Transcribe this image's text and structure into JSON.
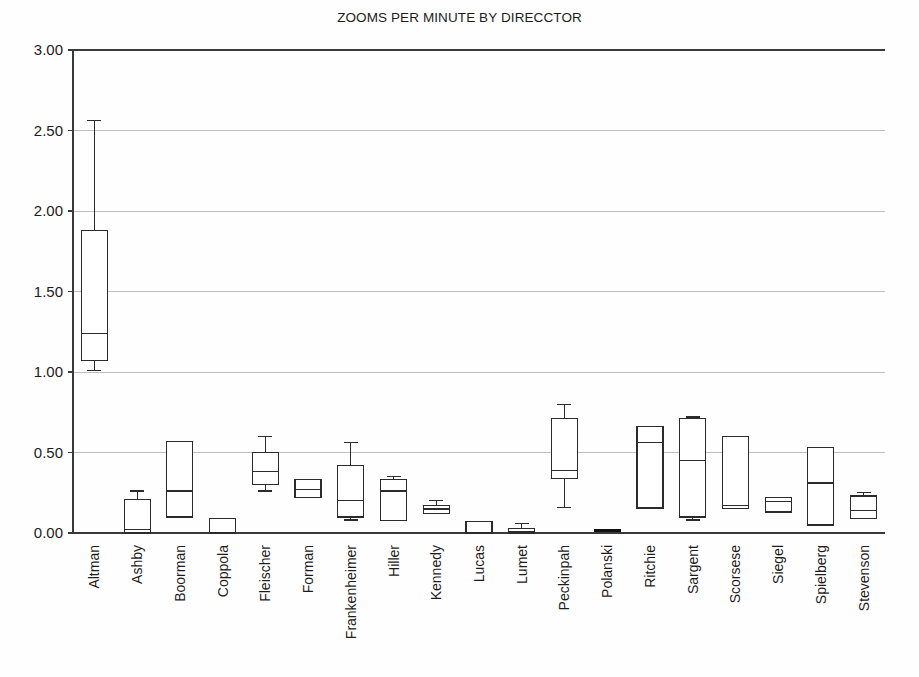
{
  "chart_data": {
    "type": "box",
    "title": "ZOOMS PER MINUTE BY DIRECCTOR",
    "xlabel": "",
    "ylabel": "",
    "ylim": [
      0.0,
      3.0
    ],
    "ytick_values": [
      0.0,
      0.5,
      1.0,
      1.5,
      2.0,
      2.5,
      3.0
    ],
    "ytick_labels": [
      "0.00",
      "0.50",
      "1.00",
      "1.50",
      "2.00",
      "2.50",
      "3.00"
    ],
    "grid": true,
    "legend": "none",
    "categories": [
      "Altman",
      "Ashby",
      "Boorman",
      "Coppola",
      "Fleischer",
      "Forman",
      "Frankenheimer",
      "Hiller",
      "Kennedy",
      "Lucas",
      "Lumet",
      "Peckinpah",
      "Polanski",
      "Ritchie",
      "Sargent",
      "Scorsese",
      "Siegel",
      "Spielberg",
      "Stevenson"
    ],
    "boxes": [
      {
        "name": "Altman",
        "whisker_low": 1.01,
        "q1": 1.07,
        "median": 1.24,
        "q3": 1.88,
        "whisker_high": 2.56
      },
      {
        "name": "Ashby",
        "whisker_low": 0.0,
        "q1": 0.0,
        "median": 0.02,
        "q3": 0.21,
        "whisker_high": 0.26
      },
      {
        "name": "Boorman",
        "whisker_low": 0.1,
        "q1": 0.1,
        "median": 0.26,
        "q3": 0.57,
        "whisker_high": 0.57
      },
      {
        "name": "Coppola",
        "whisker_low": 0.0,
        "q1": 0.0,
        "median": 0.0,
        "q3": 0.09,
        "whisker_high": 0.09
      },
      {
        "name": "Fleischer",
        "whisker_low": 0.26,
        "q1": 0.3,
        "median": 0.38,
        "q3": 0.5,
        "whisker_high": 0.6
      },
      {
        "name": "Forman",
        "whisker_low": 0.22,
        "q1": 0.22,
        "median": 0.27,
        "q3": 0.33,
        "whisker_high": 0.33
      },
      {
        "name": "Frankenheimer",
        "whisker_low": 0.08,
        "q1": 0.1,
        "median": 0.2,
        "q3": 0.42,
        "whisker_high": 0.56
      },
      {
        "name": "Hiller",
        "whisker_low": 0.08,
        "q1": 0.08,
        "median": 0.26,
        "q3": 0.33,
        "whisker_high": 0.35
      },
      {
        "name": "Kennedy",
        "whisker_low": 0.12,
        "q1": 0.12,
        "median": 0.15,
        "q3": 0.17,
        "whisker_high": 0.2
      },
      {
        "name": "Lucas",
        "whisker_low": 0.0,
        "q1": 0.0,
        "median": 0.0,
        "q3": 0.07,
        "whisker_high": 0.07
      },
      {
        "name": "Lumet",
        "whisker_low": 0.0,
        "q1": 0.0,
        "median": 0.01,
        "q3": 0.03,
        "whisker_high": 0.06
      },
      {
        "name": "Peckinpah",
        "whisker_low": 0.16,
        "q1": 0.34,
        "median": 0.39,
        "q3": 0.71,
        "whisker_high": 0.8
      },
      {
        "name": "Polanski",
        "whisker_low": 0.01,
        "q1": 0.01,
        "median": 0.015,
        "q3": 0.02,
        "whisker_high": 0.02,
        "filled": true
      },
      {
        "name": "Ritchie",
        "whisker_low": 0.155,
        "q1": 0.155,
        "median": 0.56,
        "q3": 0.66,
        "whisker_high": 0.66
      },
      {
        "name": "Sargent",
        "whisker_low": 0.08,
        "q1": 0.1,
        "median": 0.45,
        "q3": 0.71,
        "whisker_high": 0.72
      },
      {
        "name": "Scorsese",
        "whisker_low": 0.15,
        "q1": 0.15,
        "median": 0.17,
        "q3": 0.6,
        "whisker_high": 0.6
      },
      {
        "name": "Siegel",
        "whisker_low": 0.13,
        "q1": 0.13,
        "median": 0.195,
        "q3": 0.22,
        "whisker_high": 0.22
      },
      {
        "name": "Spielberg",
        "whisker_low": 0.05,
        "q1": 0.05,
        "median": 0.31,
        "q3": 0.53,
        "whisker_high": 0.53
      },
      {
        "name": "Stevenson",
        "whisker_low": 0.09,
        "q1": 0.09,
        "median": 0.14,
        "q3": 0.23,
        "whisker_high": 0.25
      }
    ]
  },
  "colors": {
    "background": "#fefefe",
    "gridline": "#bfbfbf",
    "axis": "#3a3a3a",
    "box_stroke": "#2b2b2b",
    "box_fill": "#ffffff",
    "filled_box": "#111111",
    "text": "#1c1c1c"
  }
}
